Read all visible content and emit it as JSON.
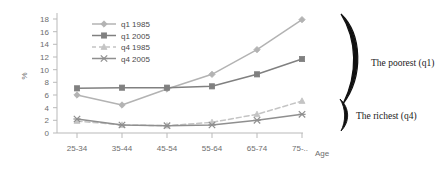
{
  "chart_data": {
    "type": "line",
    "title": "",
    "xlabel": "Age",
    "ylabel": "%",
    "ylim": [
      0,
      18
    ],
    "ytick_step": 2,
    "grid": false,
    "legend_position": "top-left-inside",
    "categories": [
      "25-34",
      "35-44",
      "45-54",
      "55-64",
      "65-74",
      "75-.."
    ],
    "yticks": [
      "0",
      "2",
      "4",
      "6",
      "8",
      "10",
      "12",
      "14",
      "16",
      "18"
    ],
    "series": [
      {
        "name": "q1 1985",
        "values": [
          5.7,
          4.2,
          6.6,
          8.8,
          12.5,
          17.0
        ],
        "color": "#b3b3b3",
        "marker": "diamond",
        "dash": "none"
      },
      {
        "name": "q1 2005",
        "values": [
          6.7,
          6.8,
          6.8,
          7.0,
          8.8,
          11.1
        ],
        "color": "#808080",
        "marker": "square",
        "dash": "none"
      },
      {
        "name": "q4 1985",
        "values": [
          1.8,
          1.2,
          1.1,
          1.6,
          2.8,
          4.8
        ],
        "color": "#c4c4c4",
        "marker": "triangle",
        "dash": "dashed"
      },
      {
        "name": "q4 2005",
        "values": [
          2.1,
          1.2,
          1.1,
          1.2,
          1.9,
          2.8
        ],
        "color": "#8f8f8f",
        "marker": "cross",
        "dash": "none"
      }
    ],
    "annotations": [
      {
        "text": "The poorest (q1)",
        "brace": "large"
      },
      {
        "text": "The richest (q4)",
        "brace": "small"
      }
    ]
  }
}
